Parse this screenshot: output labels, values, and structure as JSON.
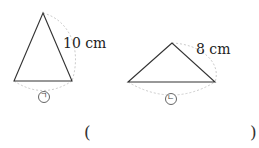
{
  "figures": [
    {
      "id": "triangle-a",
      "side_label": "10 cm",
      "marker": "ㄱ"
    },
    {
      "id": "triangle-b",
      "side_label": "8 cm",
      "marker": "ㄴ"
    }
  ],
  "answer": {
    "open": "(",
    "close": ")",
    "value": ""
  }
}
